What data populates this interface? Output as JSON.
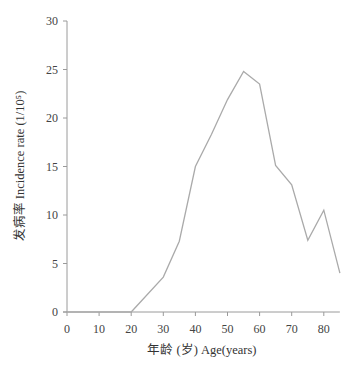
{
  "chart_data": {
    "type": "line",
    "title": "",
    "xlabel": "年龄 (岁) Age(years)",
    "ylabel": "发病率 Incidence rate (1/10⁵)",
    "xlim": [
      0,
      85
    ],
    "ylim": [
      0,
      30
    ],
    "x_ticks": [
      0,
      10,
      20,
      30,
      40,
      50,
      60,
      70,
      80
    ],
    "y_ticks": [
      0,
      5,
      10,
      15,
      20,
      25,
      30
    ],
    "grid": false,
    "legend": null,
    "series": [
      {
        "name": "Incidence rate",
        "color": "#aaaaaa",
        "x": [
          0,
          20,
          30,
          35,
          40,
          45,
          50,
          55,
          60,
          65,
          70,
          75,
          80,
          85
        ],
        "y": [
          0,
          0,
          3.6,
          7.3,
          15.0,
          18.3,
          21.9,
          24.8,
          23.5,
          15.1,
          13.1,
          7.4,
          10.5,
          4.0
        ]
      }
    ]
  },
  "colors": {
    "axis": "#9a9a9a",
    "line": "#aaaaaa",
    "text": "#333333"
  }
}
